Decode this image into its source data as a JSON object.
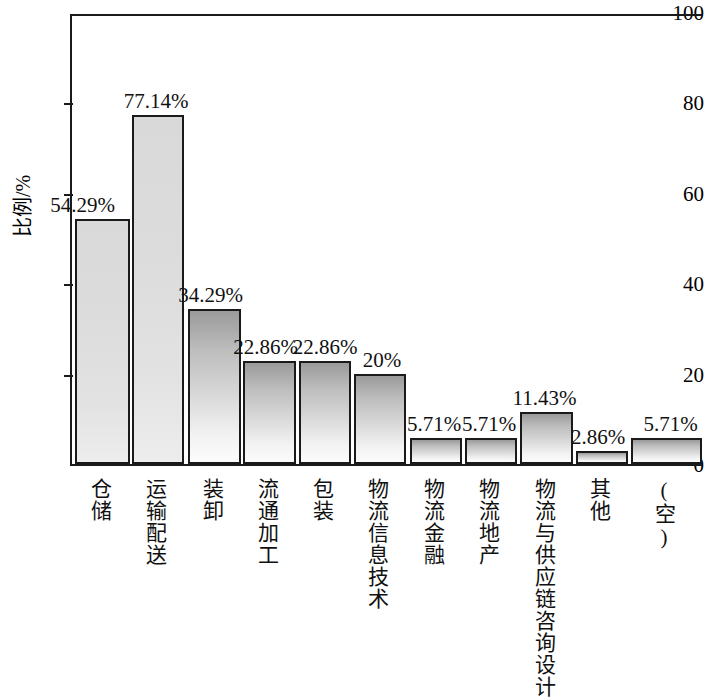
{
  "chart_data": {
    "type": "bar",
    "title": "",
    "xlabel": "",
    "ylabel": "比例/%",
    "ylim": [
      0,
      100
    ],
    "yticks": [
      0,
      20,
      40,
      60,
      80,
      100
    ],
    "grid": false,
    "legend": "none",
    "orientation": "vertical",
    "categories": [
      "仓储",
      "运输配送",
      "装卸",
      "流通加工",
      "包装",
      "物流信息技术",
      "物流金融",
      "物流地产",
      "物流与供应链咨询设计",
      "其他",
      "(空)"
    ],
    "values": [
      54.29,
      77.14,
      34.29,
      22.86,
      22.86,
      20,
      5.71,
      5.71,
      11.43,
      2.86,
      5.71
    ],
    "data_labels": [
      "54.29%",
      "77.14%",
      "34.29%",
      "22.86%",
      "22.86%",
      "20%",
      "5.71%",
      "5.71%",
      "11.43%",
      "2.86%",
      "5.71%"
    ],
    "colors": {
      "bar_outline": "#1a1a1a",
      "bar_fill_top": "#9a9a9a",
      "bar_fill_bottom": "#fcfcfc",
      "axis": "#1a1a1a",
      "text": "#111111",
      "background": "#ffffff"
    }
  }
}
